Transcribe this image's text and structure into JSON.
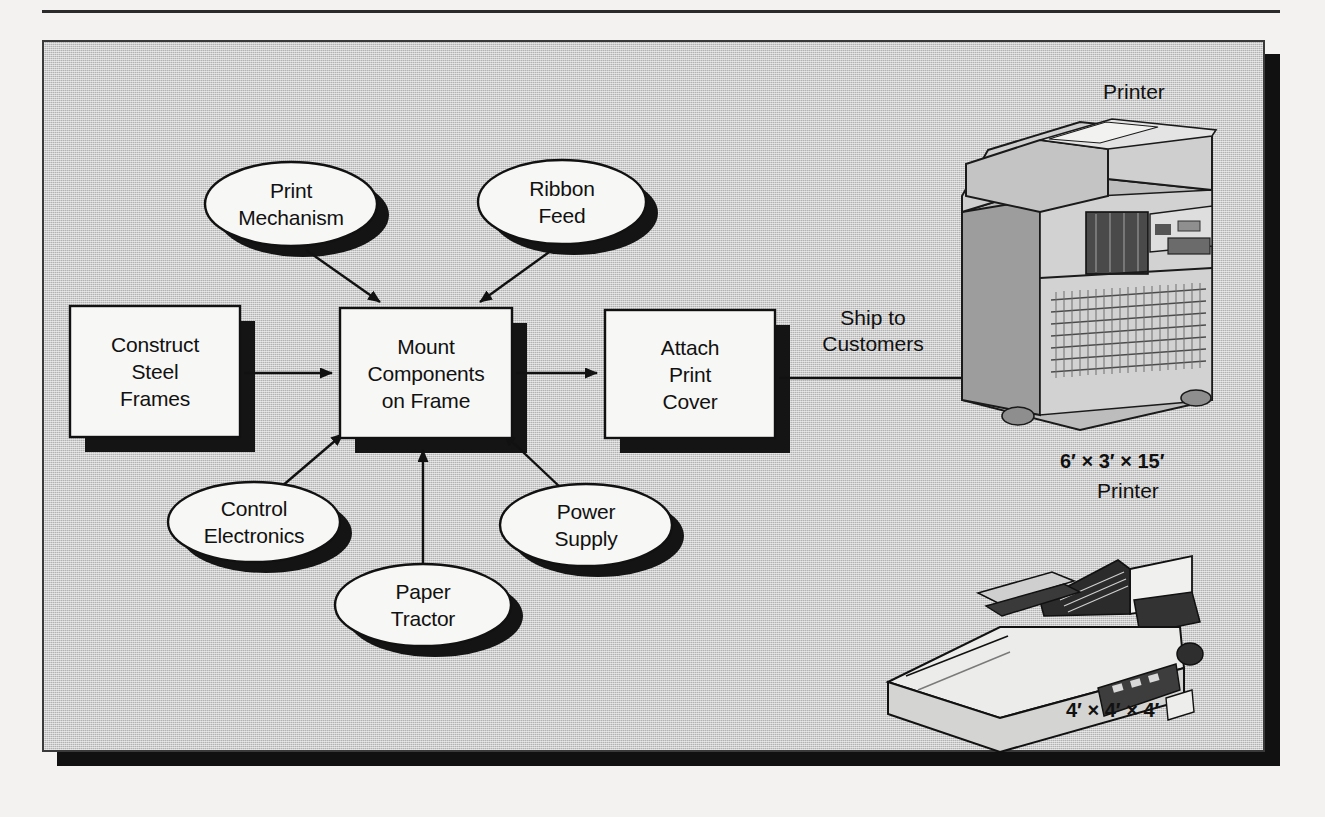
{
  "diagram": {
    "panel": {
      "background_color": "#b2b2b2",
      "shadow_color": "#111111"
    },
    "process_boxes": [
      {
        "id": "construct-steel-frames",
        "label": "Construct\nSteel\nFrames",
        "x": 70,
        "y": 306,
        "w": 170,
        "h": 131
      },
      {
        "id": "mount-components-on-frame",
        "label": "Mount\nComponents\non Frame",
        "x": 340,
        "y": 308,
        "w": 172,
        "h": 130
      },
      {
        "id": "attach-print-cover",
        "label": "Attach\nPrint\nCover",
        "x": 605,
        "y": 310,
        "w": 170,
        "h": 128
      }
    ],
    "component_ellipses": [
      {
        "id": "print-mechanism",
        "label": "Print\nMechanism",
        "cx": 291,
        "cy": 204,
        "rx": 86,
        "ry": 42
      },
      {
        "id": "ribbon-feed",
        "label": "Ribbon\nFeed",
        "cx": 562,
        "cy": 202,
        "rx": 84,
        "ry": 42
      },
      {
        "id": "control-electronics",
        "label": "Control\nElectronics",
        "cx": 254,
        "cy": 522,
        "rx": 86,
        "ry": 40
      },
      {
        "id": "power-supply",
        "label": "Power\nSupply",
        "cx": 586,
        "cy": 525,
        "rx": 86,
        "ry": 41
      },
      {
        "id": "paper-tractor",
        "label": "Paper\nTractor",
        "cx": 423,
        "cy": 605,
        "rx": 88,
        "ry": 41
      }
    ],
    "edge_labels": [
      {
        "id": "ship-to-customers",
        "label": "Ship to\nCustomers",
        "x": 793,
        "y": 305
      }
    ],
    "product_labels": [
      {
        "id": "printer-top-caption",
        "label": "Printer",
        "x": 1103,
        "y": 78
      },
      {
        "id": "printer-large-dimensions",
        "label": "6′ × 3′ × 15′",
        "x": 1060,
        "y": 448,
        "bold": true
      },
      {
        "id": "printer-large-name",
        "label": "Printer",
        "x": 1097,
        "y": 477,
        "bold": false
      },
      {
        "id": "printer-small-dimensions",
        "label": "4′ × 4′ × 4′",
        "x": 1066,
        "y": 697,
        "bold": true
      }
    ],
    "illustrations": [
      {
        "id": "large-line-printer-illustration",
        "alt": "Large floor-standing line printer"
      },
      {
        "id": "small-dot-matrix-printer-illustration",
        "alt": "Small desktop dot-matrix printer"
      }
    ],
    "connectors": [
      {
        "from": "construct-steel-frames",
        "to": "mount-components-on-frame",
        "kind": "arrow"
      },
      {
        "from": "print-mechanism",
        "to": "mount-components-on-frame",
        "kind": "arrow"
      },
      {
        "from": "ribbon-feed",
        "to": "mount-components-on-frame",
        "kind": "arrow"
      },
      {
        "from": "control-electronics",
        "to": "mount-components-on-frame",
        "kind": "arrow"
      },
      {
        "from": "paper-tractor",
        "to": "mount-components-on-frame",
        "kind": "arrow"
      },
      {
        "from": "power-supply",
        "to": "mount-components-on-frame",
        "kind": "arrow"
      },
      {
        "from": "mount-components-on-frame",
        "to": "attach-print-cover",
        "kind": "arrow"
      },
      {
        "from": "attach-print-cover",
        "to": "large-line-printer-illustration",
        "kind": "arrow",
        "label": "Ship to\nCustomers"
      }
    ]
  }
}
